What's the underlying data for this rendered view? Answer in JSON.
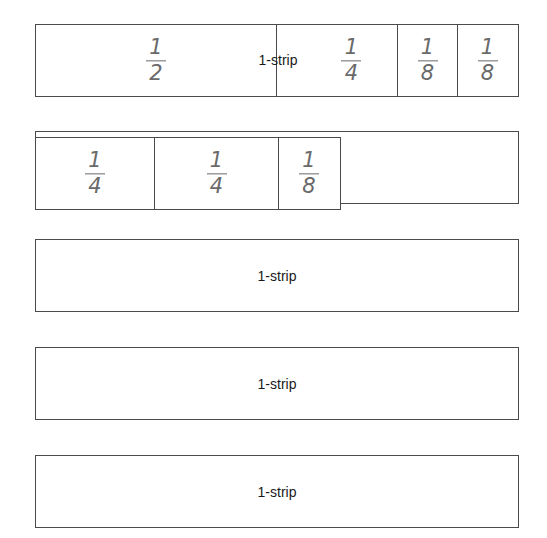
{
  "strips": [
    {
      "label": "1-strip",
      "pieces": [
        {
          "num": "1",
          "den": "2"
        },
        {
          "num": "1",
          "den": "4"
        },
        {
          "num": "1",
          "den": "8"
        },
        {
          "num": "1",
          "den": "8"
        }
      ]
    },
    {
      "label": "",
      "pieces": [
        {
          "num": "1",
          "den": "4"
        },
        {
          "num": "1",
          "den": "4"
        },
        {
          "num": "1",
          "den": "8"
        }
      ]
    },
    {
      "label": "1-strip"
    },
    {
      "label": "1-strip"
    },
    {
      "label": "1-strip"
    }
  ],
  "colors": {
    "border": "#4a4a4a",
    "fraction_ink": "#6a6a6a",
    "label_text": "#1a1a1a",
    "background": "#ffffff"
  }
}
